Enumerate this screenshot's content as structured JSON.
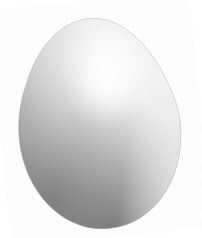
{
  "image": {
    "subject": "egg",
    "subject_label": "chicken egg",
    "description": "A single white chicken egg standing upright, tilted slightly, photographed against a plain white background",
    "background_color": "#ffffff",
    "canvas": {
      "width": 202,
      "height": 238
    },
    "caption": ""
  },
  "egg": {
    "label": "egg",
    "shell_color_light": "#fdfdfd",
    "shell_color_mid": "#d8d8d8",
    "shell_color_shadow": "#8f8f8f",
    "shell_color_deep_shadow": "#6f6f6f",
    "outline_color": "#b9b9b9",
    "geometry": {
      "center_x": 99,
      "center_y": 124,
      "radius_x": 81,
      "radius_y": 106,
      "top_y": 18,
      "bottom_y": 229,
      "left_x": 18,
      "right_x": 180,
      "tilt_degrees": -6,
      "taper_note": "narrower and more pointed at the top, broader and rounder at the bottom"
    },
    "lighting": {
      "highlight_label": "specular-highlight",
      "highlight_x": 112,
      "highlight_y": 78,
      "highlight_color": "#ffffff",
      "light_direction": "upper-right",
      "terminator_label": "shadow-terminator",
      "shadow_region": "lower-left",
      "shadow_color": "#7a7a7a"
    }
  }
}
